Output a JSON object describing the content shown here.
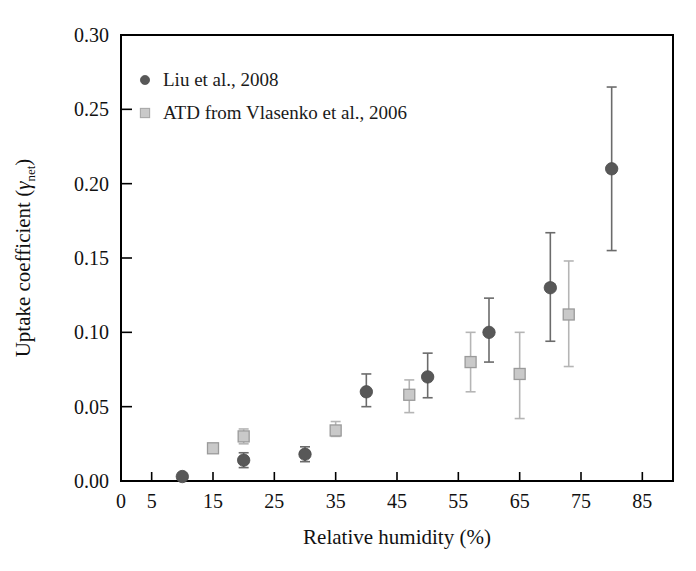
{
  "chart_data": {
    "type": "scatter",
    "title": "",
    "xlabel": "Relative humidity (%)",
    "ylabel": "Uptake coefficient (γnet)",
    "ylabel_main": "Uptake coefficient (",
    "ylabel_symbol": "γ",
    "ylabel_sub": "net",
    "ylabel_tail": ")",
    "xlim": [
      0,
      90
    ],
    "ylim": [
      0.0,
      0.3
    ],
    "grid": false,
    "xticks": [
      0,
      5,
      15,
      25,
      35,
      45,
      55,
      65,
      75,
      85
    ],
    "xticklabels": [
      "0",
      "5",
      "15",
      "25",
      "35",
      "45",
      "55",
      "65",
      "75",
      "85"
    ],
    "yticks": [
      0.0,
      0.05,
      0.1,
      0.15,
      0.2,
      0.25,
      0.3
    ],
    "yticklabels": [
      "0.00",
      "0.05",
      "0.10",
      "0.15",
      "0.20",
      "0.25",
      "0.30"
    ],
    "legend_position": "top-left",
    "series": [
      {
        "name": "Liu et al., 2008",
        "marker": "circle",
        "color": "#585858",
        "points": [
          {
            "x": 10,
            "y": 0.003,
            "yerr_low": 0.003,
            "yerr_high": 0.003
          },
          {
            "x": 20,
            "y": 0.014,
            "yerr_low": 0.009,
            "yerr_high": 0.019
          },
          {
            "x": 30,
            "y": 0.018,
            "yerr_low": 0.013,
            "yerr_high": 0.023
          },
          {
            "x": 40,
            "y": 0.06,
            "yerr_low": 0.05,
            "yerr_high": 0.072
          },
          {
            "x": 50,
            "y": 0.07,
            "yerr_low": 0.056,
            "yerr_high": 0.086
          },
          {
            "x": 60,
            "y": 0.1,
            "yerr_low": 0.08,
            "yerr_high": 0.123
          },
          {
            "x": 70,
            "y": 0.13,
            "yerr_low": 0.094,
            "yerr_high": 0.167
          },
          {
            "x": 80,
            "y": 0.21,
            "yerr_low": 0.155,
            "yerr_high": 0.265
          }
        ]
      },
      {
        "name": "ATD from Vlasenko et al., 2006",
        "marker": "square",
        "color": "#c9c9c9",
        "points": [
          {
            "x": 15,
            "y": 0.022,
            "yerr_low": 0.022,
            "yerr_high": 0.022
          },
          {
            "x": 20,
            "y": 0.03,
            "yerr_low": 0.025,
            "yerr_high": 0.035
          },
          {
            "x": 35,
            "y": 0.034,
            "yerr_low": 0.03,
            "yerr_high": 0.04
          },
          {
            "x": 47,
            "y": 0.058,
            "yerr_low": 0.046,
            "yerr_high": 0.068
          },
          {
            "x": 57,
            "y": 0.08,
            "yerr_low": 0.06,
            "yerr_high": 0.1
          },
          {
            "x": 65,
            "y": 0.072,
            "yerr_low": 0.042,
            "yerr_high": 0.1
          },
          {
            "x": 73,
            "y": 0.112,
            "yerr_low": 0.077,
            "yerr_high": 0.148
          }
        ]
      }
    ]
  },
  "legend": {
    "items": [
      {
        "label": "Liu et al., 2008",
        "marker": "circle",
        "color": "#585858"
      },
      {
        "label": "ATD from Vlasenko et al., 2006",
        "marker": "square",
        "color": "#c9c9c9"
      }
    ]
  }
}
